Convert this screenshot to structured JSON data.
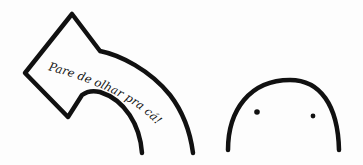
{
  "meme": {
    "arrow_text": "Pare de olhar pra cá!",
    "arrow_direction": "up-left",
    "character": "blob-face"
  },
  "colors": {
    "ink": "#111111",
    "background": "#fdfdfd"
  }
}
